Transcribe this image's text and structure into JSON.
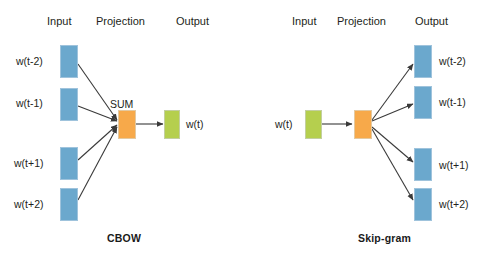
{
  "figure": {
    "background_color": "#ffffff",
    "width": 496,
    "height": 265
  },
  "colors": {
    "input_box_fill": "#6ba8cd",
    "input_box_border": "#9fc3dc",
    "projection_box_fill": "#f7a94a",
    "projection_box_border": "#e4c9a0",
    "output_box_fill": "#b5cf4e",
    "output_box_border": "#c3cfa0",
    "arrow": "#3a3a3a",
    "text": "#231f20"
  },
  "cbow": {
    "title": "CBOW",
    "column_headers": {
      "input": "Input",
      "projection": "Projection",
      "output": "Output"
    },
    "sum_label": "SUM",
    "input_nodes": [
      {
        "label": "w(t-2)"
      },
      {
        "label": "w(t-1)"
      },
      {
        "label": "w(t+1)"
      },
      {
        "label": "w(t+2)"
      }
    ],
    "projection_node": {
      "label": ""
    },
    "output_nodes": [
      {
        "label": "w(t)"
      }
    ]
  },
  "skipgram": {
    "title": "Skip-gram",
    "column_headers": {
      "input": "Input",
      "projection": "Projection",
      "output": "Output"
    },
    "input_nodes": [
      {
        "label": "w(t)"
      }
    ],
    "projection_node": {
      "label": ""
    },
    "output_nodes": [
      {
        "label": "w(t-2)"
      },
      {
        "label": "w(t-1)"
      },
      {
        "label": "w(t+1)"
      },
      {
        "label": "w(t+2)"
      }
    ]
  }
}
